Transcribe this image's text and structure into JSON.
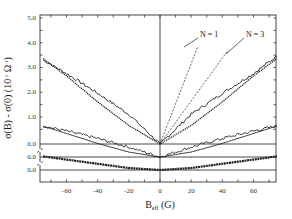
{
  "chart_data": {
    "type": "line",
    "title": "",
    "xlabel": "B_eff (G)",
    "xlabel_main": "B",
    "xlabel_sub": "eff",
    "xlabel_unit": "(G)",
    "ylabel": "σ(B) - σ(0) (10^-5 Ω^-1)",
    "ylabel_parts": {
      "main": "σ(B) - σ(0) (10",
      "exp1": "-5",
      "mid": " Ω",
      "exp2": "-1",
      "end": ")"
    },
    "xlim": [
      -75,
      75
    ],
    "ylim": [
      0,
      5.0
    ],
    "grid": false,
    "legend": "annotations",
    "x_ticks": [
      -60,
      -40,
      -20,
      0,
      20,
      40,
      60
    ],
    "x_tick_labels": [
      "-60",
      "-40",
      "-20",
      "0",
      "20",
      "40",
      "60"
    ],
    "y_tick_labels": [
      "5.0",
      "4.0",
      "3.0",
      "2.0",
      "1.0",
      "0.0",
      "0.0",
      "0.0"
    ],
    "y_tick_values": [
      5.0,
      4.0,
      3.0,
      2.0,
      1.0,
      0.0,
      0.0,
      0.0
    ],
    "offset_baselines": [
      {
        "label": "0.0",
        "note": "baseline of top curve pair (offset)"
      },
      {
        "label": "0.0",
        "note": "baseline of middle curve pair (offset)"
      },
      {
        "label": "0.0",
        "note": "baseline of bottom curve pair"
      }
    ],
    "annotations": [
      {
        "text": "N = 1",
        "target": "dashed line, steeper"
      },
      {
        "text": "N = 3",
        "target": "dashed line, shallower"
      }
    ],
    "series": [
      {
        "name": "top-experimental",
        "style": "solid-noisy",
        "baseline_index": 0,
        "x": [
          -75,
          -60,
          -40,
          -20,
          0,
          20,
          40,
          60,
          75
        ],
        "y": [
          3.4,
          2.85,
          2.05,
          1.2,
          0.0,
          1.2,
          2.05,
          2.85,
          3.55
        ]
      },
      {
        "name": "top-fit",
        "style": "dotted",
        "baseline_index": 0,
        "x": [
          -75,
          -60,
          -40,
          -20,
          0,
          20,
          40,
          60,
          75
        ],
        "y": [
          3.45,
          2.75,
          1.7,
          0.75,
          0.0,
          0.75,
          1.7,
          2.75,
          3.45
        ]
      },
      {
        "name": "middle-experimental",
        "style": "solid-noisy",
        "baseline_index": 1,
        "x": [
          -75,
          -60,
          -40,
          -20,
          0,
          20,
          40,
          60,
          75
        ],
        "y": [
          1.25,
          1.05,
          0.75,
          0.4,
          0.0,
          0.4,
          0.75,
          1.05,
          1.25
        ]
      },
      {
        "name": "middle-fit",
        "style": "solid-smooth",
        "baseline_index": 1,
        "x": [
          -75,
          -60,
          -40,
          -20,
          0,
          20,
          40,
          60,
          75
        ],
        "y": [
          1.25,
          0.95,
          0.55,
          0.2,
          0.0,
          0.2,
          0.55,
          0.95,
          1.25
        ]
      },
      {
        "name": "bottom-experimental",
        "style": "thick-dotted",
        "baseline_index": 2,
        "x": [
          -75,
          -60,
          -40,
          -20,
          0,
          20,
          40,
          60,
          75
        ],
        "y": [
          0.55,
          0.42,
          0.25,
          0.08,
          0.0,
          0.08,
          0.25,
          0.42,
          0.55
        ]
      },
      {
        "name": "N = 1",
        "style": "dashed",
        "baseline_index": 0,
        "x": [
          0,
          8,
          16,
          24
        ],
        "y": [
          0.0,
          1.3,
          2.6,
          3.9
        ]
      },
      {
        "name": "N = 3",
        "style": "dashed",
        "baseline_index": 0,
        "x": [
          0,
          15,
          30,
          45
        ],
        "y": [
          0.0,
          1.3,
          2.6,
          3.9
        ]
      }
    ]
  }
}
